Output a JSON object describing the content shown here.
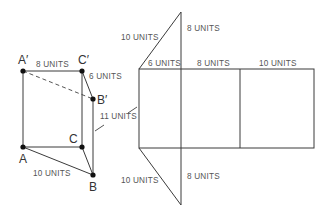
{
  "prism": {
    "vertices": {
      "A_prime": "A′",
      "C_prime": "C′",
      "B_prime": "B′",
      "A": "A",
      "B": "B",
      "C": "C"
    },
    "dimensions": {
      "a_prime_c_prime": "8 UNITS",
      "c_prime_b_prime": "6 UNITS",
      "height": "11 UNITS",
      "a_b": "10 UNITS"
    }
  },
  "net": {
    "top_triangle": {
      "hypotenuse": "10 UNITS",
      "vertical_leg": "8 UNITS",
      "base": "6 UNITS"
    },
    "rectangles": {
      "width_1": "8 UNITS",
      "width_2": "10 UNITS"
    },
    "bottom_triangle": {
      "hypotenuse": "10 UNITS",
      "vertical_leg": "8 UNITS"
    }
  },
  "colors": {
    "line": "#3a3a3a",
    "label": "#555555",
    "vertex": "#111111"
  }
}
